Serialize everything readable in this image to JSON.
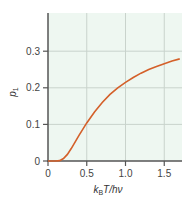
{
  "chart_data": {
    "type": "line",
    "title": "",
    "xlabel": "k_B T/hν",
    "xlabel_parts": {
      "k": "k",
      "sub": "B",
      "rest": "T/hν"
    },
    "ylabel": "p_1",
    "ylabel_parts": {
      "p": "p",
      "sub": "1"
    },
    "xlim": [
      0,
      1.7
    ],
    "ylim": [
      0,
      0.38
    ],
    "x_ticks": [
      0,
      0.5,
      1.0,
      1.5
    ],
    "x_tick_labels": [
      "0",
      "0.5",
      "1.0",
      "1.5"
    ],
    "y_ticks": [
      0,
      0.1,
      0.2,
      0.3
    ],
    "y_tick_labels": [
      "0",
      "0.1",
      "0.2",
      "0.3"
    ],
    "grid": true,
    "colors": {
      "line": "#d4602a",
      "background": "#eef7f1",
      "grid": "#c9d3cc",
      "axis": "#555555"
    },
    "series": [
      {
        "name": "p1",
        "x": [
          0,
          0.1,
          0.15,
          0.2,
          0.25,
          0.3,
          0.4,
          0.5,
          0.6,
          0.7,
          0.8,
          0.9,
          1.0,
          1.1,
          1.2,
          1.3,
          1.4,
          1.5,
          1.6,
          1.7
        ],
        "y": [
          0,
          0.0,
          0.001,
          0.0066,
          0.018,
          0.034,
          0.07,
          0.104,
          0.134,
          0.16,
          0.182,
          0.2,
          0.215,
          0.228,
          0.24,
          0.25,
          0.258,
          0.266,
          0.273,
          0.279
        ]
      }
    ]
  }
}
